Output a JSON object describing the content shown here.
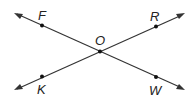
{
  "diagram": {
    "type": "intersecting-lines",
    "lines": [
      {
        "name": "line-FW",
        "through": [
          "F",
          "O",
          "W"
        ],
        "arrows_both_ends": true
      },
      {
        "name": "line-KR",
        "through": [
          "K",
          "O",
          "R"
        ],
        "arrows_both_ends": true
      }
    ],
    "points": [
      {
        "label": "F"
      },
      {
        "label": "R"
      },
      {
        "label": "O"
      },
      {
        "label": "K"
      },
      {
        "label": "W"
      }
    ],
    "intersection": "O",
    "colors": {
      "line": "#333333",
      "point": "#111111",
      "background": "#ffffff"
    }
  }
}
